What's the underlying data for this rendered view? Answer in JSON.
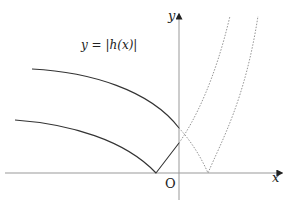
{
  "diagram": {
    "type": "function-graph",
    "function_label": "y = |h(x)|",
    "axes": {
      "x_label": "x",
      "y_label": "y",
      "origin_label": "O"
    },
    "curves": [
      {
        "name": "solid-upper",
        "style": "solid",
        "description": "upper decreasing curve ending on y-axis"
      },
      {
        "name": "solid-lower",
        "style": "solid",
        "description": "lower curve reflected to touch x-axis left of origin, then rising to y-axis"
      },
      {
        "name": "dotted-rising",
        "style": "dotted",
        "description": "continuation rising steeply right of y-axis"
      },
      {
        "name": "dotted-v",
        "style": "dotted",
        "description": "V-shaped reflected curve touching x-axis right of origin"
      }
    ],
    "colors": {
      "axis": "#999999",
      "solid": "#333333",
      "dotted": "#888888"
    }
  }
}
